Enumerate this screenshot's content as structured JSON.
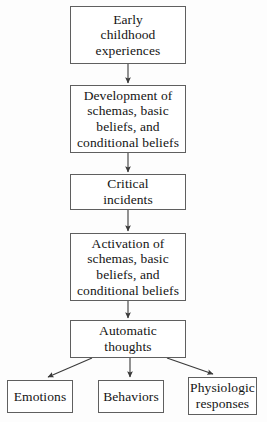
{
  "diagram": {
    "type": "flowchart",
    "orientation": "top-to-bottom",
    "background_color": "#fdfdfd",
    "box_border_color": "#5f5f5f",
    "text_color": "#141414",
    "arrow_color": "#3a3a3a",
    "nodes": [
      {
        "id": "early",
        "label": "Early\nchildhood\nexperiences"
      },
      {
        "id": "development",
        "label": "Development of\nschemas, basic\nbeliefs, and\nconditional beliefs"
      },
      {
        "id": "critical",
        "label": "Critical\nincidents"
      },
      {
        "id": "activation",
        "label": "Activation of\nschemas, basic\nbeliefs, and\nconditional beliefs"
      },
      {
        "id": "automatic",
        "label": "Automatic\nthoughts"
      },
      {
        "id": "emotions",
        "label": "Emotions"
      },
      {
        "id": "behaviors",
        "label": "Behaviors"
      },
      {
        "id": "physiologic",
        "label": "Physiologic\nresponses"
      }
    ],
    "edges": [
      {
        "from": "early",
        "to": "development",
        "style": "straight-down"
      },
      {
        "from": "development",
        "to": "critical",
        "style": "straight-down"
      },
      {
        "from": "critical",
        "to": "activation",
        "style": "straight-down"
      },
      {
        "from": "activation",
        "to": "automatic",
        "style": "straight-down"
      },
      {
        "from": "automatic",
        "to": "emotions",
        "style": "diagonal-left"
      },
      {
        "from": "automatic",
        "to": "behaviors",
        "style": "straight-down"
      },
      {
        "from": "automatic",
        "to": "physiologic",
        "style": "diagonal-right"
      }
    ]
  }
}
